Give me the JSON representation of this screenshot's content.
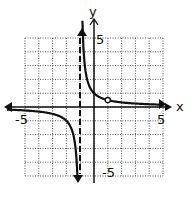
{
  "chart_data": {
    "type": "line",
    "title": "",
    "xlabel": "x",
    "ylabel": "y",
    "xlim": [
      -5,
      5
    ],
    "ylim": [
      -5,
      5
    ],
    "grid": true,
    "tick_labels": {
      "x": [
        "-5",
        "5"
      ],
      "y": [
        "5",
        "-5"
      ]
    },
    "function": "y = 1/(x+1), x ≠ 1",
    "vertical_asymptote": -1,
    "horizontal_asymptote": 0,
    "hole": {
      "x": 1,
      "y": 0.5
    },
    "series": [
      {
        "name": "left branch",
        "x": [
          -5,
          -4,
          -3,
          -2.5,
          -2,
          -1.5,
          -1.25,
          -1.2
        ],
        "y": [
          -0.25,
          -0.33,
          -0.5,
          -0.67,
          -1,
          -2,
          -4,
          -5
        ]
      },
      {
        "name": "right branch",
        "x": [
          -0.8,
          -0.75,
          -0.5,
          0,
          0.5,
          1,
          2,
          3,
          4,
          5
        ],
        "y": [
          5,
          4,
          2,
          1,
          0.67,
          0.5,
          0.33,
          0.25,
          0.2,
          0.17
        ]
      }
    ]
  },
  "labels": {
    "x_axis": "x",
    "y_axis": "y",
    "x_min": "-5",
    "x_max": "5",
    "y_max": "5",
    "y_min": "-5"
  }
}
